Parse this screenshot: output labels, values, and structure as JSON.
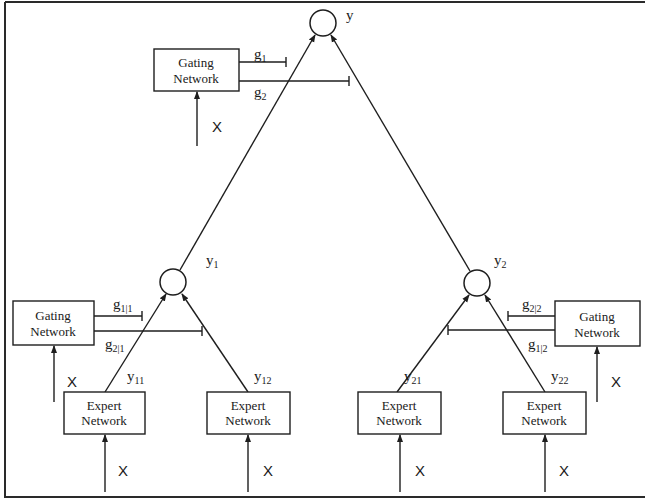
{
  "diagram": {
    "root_node": {
      "label": "y"
    },
    "top_gating": {
      "line1": "Gating",
      "line2": "Network",
      "input": "X",
      "outputs": [
        {
          "base": "g",
          "sub": "1"
        },
        {
          "base": "g",
          "sub": "2"
        }
      ]
    },
    "left_node": {
      "base": "y",
      "sub": "1"
    },
    "right_node": {
      "base": "y",
      "sub": "2"
    },
    "left_gating": {
      "line1": "Gating",
      "line2": "Network",
      "input": "X",
      "outputs": [
        {
          "base": "g",
          "sub": "1|1"
        },
        {
          "base": "g",
          "sub": "2|1"
        }
      ]
    },
    "right_gating": {
      "line1": "Gating",
      "line2": "Network",
      "input": "X",
      "outputs": [
        {
          "base": "g",
          "sub": "2|2"
        },
        {
          "base": "g",
          "sub": "1|2"
        }
      ]
    },
    "experts": [
      {
        "line1": "Expert",
        "line2": "Network",
        "output": {
          "base": "y",
          "sub": "11"
        },
        "input": "X"
      },
      {
        "line1": "Expert",
        "line2": "Network",
        "output": {
          "base": "y",
          "sub": "12"
        },
        "input": "X"
      },
      {
        "line1": "Expert",
        "line2": "Network",
        "output": {
          "base": "y",
          "sub": "21"
        },
        "input": "X"
      },
      {
        "line1": "Expert",
        "line2": "Network",
        "output": {
          "base": "y",
          "sub": "22"
        },
        "input": "X"
      }
    ]
  }
}
